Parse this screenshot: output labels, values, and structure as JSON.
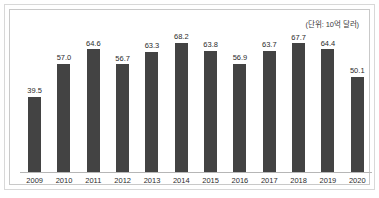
{
  "chart_data": {
    "type": "bar",
    "title": "",
    "subtitle": "",
    "unit_note": "(단위: 10억 달러)",
    "xlabel": "",
    "ylabel": "",
    "categories": [
      "2009",
      "2010",
      "2011",
      "2012",
      "2013",
      "2014",
      "2015",
      "2016",
      "2017",
      "2018",
      "2019",
      "2020"
    ],
    "values": [
      39.5,
      57.0,
      64.6,
      56.7,
      63.3,
      68.2,
      63.8,
      56.9,
      63.7,
      67.7,
      64.4,
      50.1
    ],
    "value_labels": [
      "39.5",
      "57.0",
      "64.6",
      "56.7",
      "63.3",
      "68.2",
      "63.8",
      "56.9",
      "63.7",
      "67.7",
      "64.4",
      "50.1"
    ],
    "ylim": [
      0,
      82
    ],
    "grid": false,
    "legend": null,
    "bar_color": "#434343",
    "axis_color": "#b6b6b6",
    "text_color": "#2b2b2b",
    "frame_color": "#d8d8d8"
  }
}
